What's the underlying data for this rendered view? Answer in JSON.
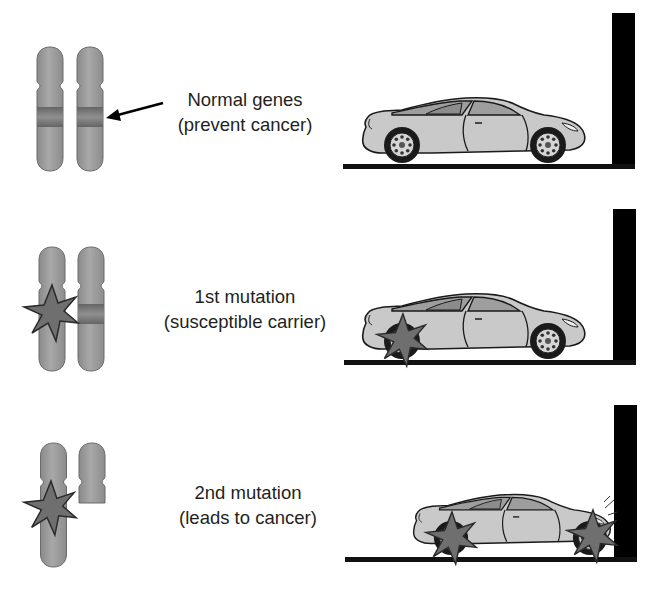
{
  "rows": [
    {
      "id": "normal",
      "label_line1": "Normal genes",
      "label_line2": "(prevent cancer)",
      "chromosome_state": "both-normal",
      "car_state": "intact"
    },
    {
      "id": "first-mutation",
      "label_line1": "1st mutation",
      "label_line2": "(susceptible carrier)",
      "chromosome_state": "one-mutated",
      "car_state": "rear-wheel-damaged"
    },
    {
      "id": "second-mutation",
      "label_line1": "2nd mutation",
      "label_line2": "(leads to cancer)",
      "chromosome_state": "both-mutated",
      "car_state": "crashed-into-wall"
    }
  ],
  "colors": {
    "chromosome": "#9a9a9a",
    "chromosome_band": "#7a7a7a",
    "mutation_star": "#6f6f6f",
    "car_body": "#c8c8c8",
    "wall": "#000000",
    "ground": "#111111",
    "text": "#231f20"
  }
}
